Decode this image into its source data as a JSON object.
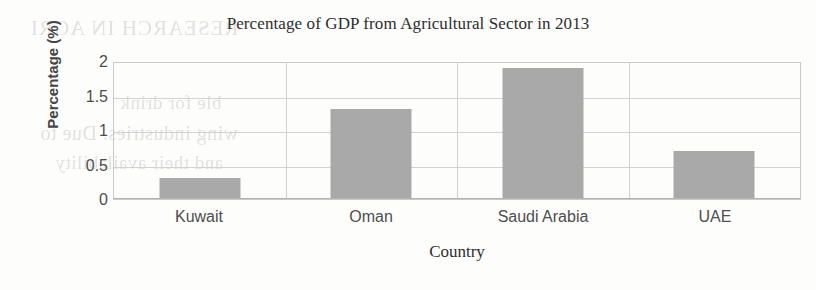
{
  "chart_data": {
    "type": "bar",
    "title": "Percentage of GDP from Agricultural Sector in 2013",
    "xlabel": "Country",
    "ylabel": "Percentage (%)",
    "categories": [
      "Kuwait",
      "Oman",
      "Saudi Arabia",
      "UAE"
    ],
    "values": [
      0.3,
      1.3,
      1.9,
      0.7
    ],
    "ylim": [
      0,
      2
    ],
    "yticks": [
      "0",
      "0.5",
      "1",
      "1.5",
      "2"
    ],
    "ytick_values": [
      0,
      0.5,
      1,
      1.5,
      2
    ],
    "grid": true,
    "legend": "none",
    "bar_color": "#a9a9a9",
    "gridline_color": "#d2d2d2",
    "axis_color": "#c9c9c9",
    "text_color": "#4d4d4d"
  },
  "ghost_text": {
    "line1": "RESEARCH IN AGRI",
    "line2": "ble for drink",
    "line3": "wing industries. Due to",
    "line4": "and their availability"
  }
}
